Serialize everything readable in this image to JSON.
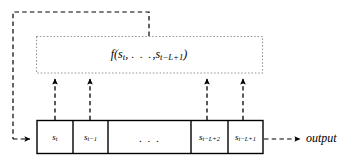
{
  "figure": {
    "colors": {
      "stroke": "#000000",
      "dotted_box": "#8c8c8c",
      "background": "#ffffff"
    }
  },
  "function_block": {
    "name": "function-block",
    "label": "f(s_t, ..., s_{t-L+1})",
    "label_parts": {
      "fn": "f",
      "open_paren": "(",
      "first_arg_base": "s",
      "first_arg_sub": "t",
      "comma1": ",",
      "ellipsis": ". . .",
      "comma2": ",",
      "last_arg_base": "s",
      "last_arg_sub": "t−L+1",
      "close_paren": ")"
    }
  },
  "register": {
    "name": "shift-register",
    "cells": [
      {
        "base": "s",
        "sub": "t",
        "has_tap": true
      },
      {
        "base": "s",
        "sub": "t−1",
        "has_tap": true
      },
      {
        "base": "",
        "sub": "",
        "ellipsis": ". . .",
        "has_tap": false
      },
      {
        "base": "s",
        "sub": "t−L+2",
        "has_tap": true
      },
      {
        "base": "s",
        "sub": "t−L+1",
        "has_tap": true
      }
    ]
  },
  "output": {
    "name": "output-label",
    "label": "output"
  },
  "connections": {
    "feedback_path_label": "feedback from function block to register input",
    "tap_arrows": 4,
    "output_arrow": "register to output"
  }
}
